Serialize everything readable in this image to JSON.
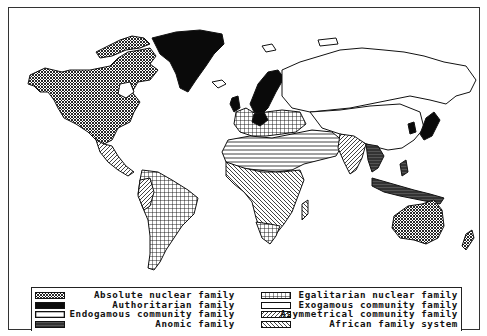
{
  "figure": {
    "type": "world choropleth map (black-and-white hatch patterns)"
  },
  "legend": {
    "left": [
      {
        "label": "Absolute nuclear family",
        "pattern": "dots-crosshatch",
        "pattern_id": "p-absolute"
      },
      {
        "label": "Authoritarian family",
        "pattern": "solid-black",
        "pattern_id": "p-authoritarian"
      },
      {
        "label": "Endogamous community family",
        "pattern": "white-with-black-border",
        "pattern_id": "p-endogamous"
      },
      {
        "label": "Anomic family",
        "pattern": "dark-gray-dense",
        "pattern_id": "p-anomic"
      }
    ],
    "right": [
      {
        "label": "Egalitarian nuclear family",
        "pattern": "grid-squares",
        "pattern_id": "p-egalitarian"
      },
      {
        "label": "Exogamous community family",
        "pattern": "white-empty",
        "pattern_id": "p-exogamous"
      },
      {
        "label": "Asymmetrical community family",
        "pattern": "diagonal-hatch",
        "pattern_id": "p-asymmetric"
      },
      {
        "label": "African family system",
        "pattern": "reverse-diagonal-hatch",
        "pattern_id": "p-african"
      }
    ]
  },
  "regions": [
    {
      "name": "North America (USA/Canada)",
      "family": "Absolute nuclear family"
    },
    {
      "name": "Greenland",
      "family": "Authoritarian family"
    },
    {
      "name": "Scandinavia / Germany",
      "family": "Authoritarian family"
    },
    {
      "name": "Japan / Korea",
      "family": "Authoritarian family"
    },
    {
      "name": "Australia",
      "family": "Absolute nuclear family"
    },
    {
      "name": "New Zealand",
      "family": "Absolute nuclear family"
    },
    {
      "name": "Latin America",
      "family": "Egalitarian nuclear family"
    },
    {
      "name": "Russia / China / Mongolia",
      "family": "Exogamous community family"
    },
    {
      "name": "North Africa / Middle East",
      "family": "Endogamous community family"
    },
    {
      "name": "India",
      "family": "Asymmetrical community family"
    },
    {
      "name": "Sub-Saharan Africa",
      "family": "African family system"
    },
    {
      "name": "Southeast Asia",
      "family": "Anomic family"
    }
  ],
  "colors": {
    "ink": "#111111",
    "paper": "#ffffff",
    "border": "#333333"
  }
}
